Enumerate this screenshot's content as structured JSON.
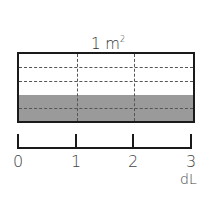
{
  "diagram": {
    "area_label": {
      "value": "1",
      "unit": "m",
      "exponent": "2"
    },
    "rectangle": {
      "columns": 3,
      "rows": 4,
      "shaded_rows": 2,
      "shade_color": "#9a9a9a",
      "border_color": "#1a1a1a"
    },
    "number_line": {
      "ticks": [
        "0",
        "1",
        "2",
        "3"
      ],
      "unit": "dL"
    }
  }
}
